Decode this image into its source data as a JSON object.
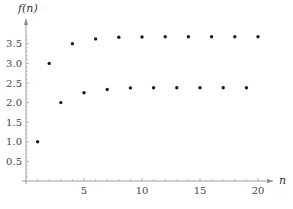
{
  "chart_data": {
    "type": "scatter",
    "title": "",
    "xlabel": "n",
    "ylabel": "f(n)",
    "xlim": [
      0,
      21
    ],
    "ylim": [
      0,
      3.8
    ],
    "grid": false,
    "legend": null,
    "x_ticks": [
      5,
      10,
      15,
      20
    ],
    "y_ticks": [
      0.5,
      1.0,
      1.5,
      2.0,
      2.5,
      3.0,
      3.5
    ],
    "x_tick_labels": [
      "5",
      "10",
      "15",
      "20"
    ],
    "y_tick_labels": [
      "0.5",
      "1.0",
      "1.5",
      "2.0",
      "2.5",
      "3.0",
      "3.5"
    ],
    "series": [
      {
        "name": "f(n)",
        "x": [
          1,
          2,
          3,
          4,
          5,
          6,
          7,
          8,
          9,
          10,
          11,
          12,
          13,
          14,
          15,
          16,
          17,
          18,
          19,
          20
        ],
        "values": [
          1.0,
          3.0,
          2.0,
          3.5,
          2.25,
          3.625,
          2.333,
          3.667,
          2.375,
          3.675,
          2.38,
          3.68,
          2.38,
          3.68,
          2.38,
          3.68,
          2.38,
          3.68,
          2.38,
          3.68
        ]
      }
    ]
  }
}
